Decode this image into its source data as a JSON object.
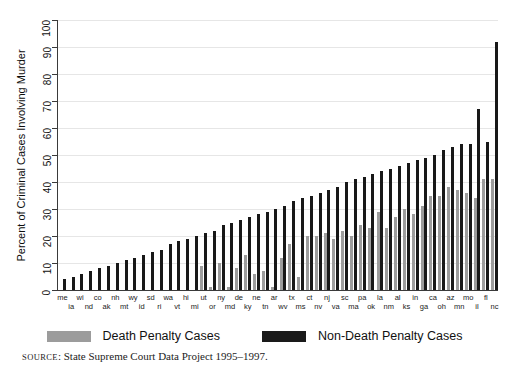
{
  "chart_data": {
    "type": "bar",
    "title": "",
    "xlabel": "",
    "ylabel": "Percent of Criminal Cases Involving Murder",
    "ylim": [
      0,
      100
    ],
    "ytick_step": 10,
    "yticks": [
      0,
      10,
      20,
      30,
      40,
      50,
      60,
      70,
      80,
      90,
      100
    ],
    "grid": "horizontal",
    "legend_position": "below-plot",
    "categories": [
      "me",
      "ia",
      "wi",
      "nd",
      "co",
      "ak",
      "nh",
      "mt",
      "wy",
      "id",
      "sd",
      "ri",
      "wa",
      "vt",
      "hi",
      "mi",
      "ut",
      "or",
      "ny",
      "md",
      "de",
      "ky",
      "ne",
      "tn",
      "ar",
      "wv",
      "tx",
      "ms",
      "ct",
      "nv",
      "nj",
      "va",
      "sc",
      "ma",
      "pa",
      "ok",
      "la",
      "nm",
      "al",
      "ks",
      "in",
      "ga",
      "ca",
      "oh",
      "az",
      "mn",
      "mo",
      "il",
      "fl",
      "nc"
    ],
    "series": [
      {
        "name": "Death Penalty Cases",
        "color": "#9c9c9c",
        "values": [
          0,
          0,
          0,
          0,
          0,
          0,
          0,
          0,
          0,
          0,
          0,
          0,
          0,
          0,
          0,
          0,
          9,
          1,
          10,
          1,
          8,
          13,
          6,
          7,
          1,
          12,
          17,
          5,
          20,
          20,
          21,
          19,
          22,
          20,
          24,
          23,
          29,
          23,
          27,
          30,
          28,
          31,
          35,
          35,
          38,
          37,
          36,
          34,
          41,
          41
        ]
      },
      {
        "name": "Non-Death Penalty Cases",
        "color": "#181818",
        "values": [
          4,
          5,
          6,
          7,
          8,
          9,
          10,
          11,
          12,
          13,
          14,
          15,
          17,
          18,
          19,
          20,
          21,
          22,
          24,
          25,
          26,
          27,
          28,
          29,
          30,
          31,
          33,
          34,
          35,
          36,
          37,
          38,
          40,
          41,
          42,
          43,
          44,
          45,
          46,
          47,
          48,
          49,
          50,
          52,
          53,
          54,
          54,
          67,
          55,
          92
        ]
      }
    ]
  },
  "legend": {
    "items": [
      {
        "label": "Death Penalty Cases",
        "swatch": "gray"
      },
      {
        "label": "Non-Death Penalty Cases",
        "swatch": "black"
      }
    ]
  },
  "source": {
    "label": "source",
    "separator": ": ",
    "text": "State Supreme Court Data Project 1995–1997."
  }
}
